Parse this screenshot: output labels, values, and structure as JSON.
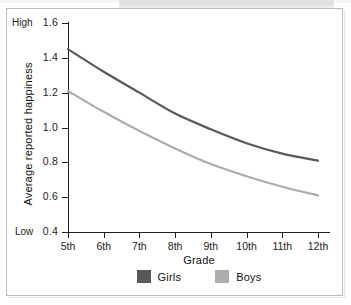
{
  "figure": {
    "background_color": "#ffffff",
    "frame_color": "#b9b9b9"
  },
  "chart_data": {
    "type": "line",
    "title": "",
    "xlabel": "Grade",
    "ylabel": "Average reported happiness",
    "categories": [
      "5th",
      "6th",
      "7th",
      "8th",
      "9th",
      "10th",
      "11th",
      "12th"
    ],
    "x": [
      5,
      6,
      7,
      8,
      9,
      10,
      11,
      12
    ],
    "xlim": [
      5,
      12
    ],
    "ylim": [
      0.4,
      1.6
    ],
    "yticks": [
      "1.6",
      "1.4",
      "1.2",
      "1.0",
      "0.8",
      "0.6",
      "0.4"
    ],
    "ytick_values": [
      1.6,
      1.4,
      1.2,
      1.0,
      0.8,
      0.6,
      0.4
    ],
    "y_axis_endpoint_labels": {
      "high": "High",
      "low": "Low"
    },
    "grid": false,
    "legend_position": "bottom-center",
    "series": [
      {
        "name": "Girls",
        "color": "#595959",
        "values": [
          1.45,
          1.32,
          1.2,
          1.08,
          0.99,
          0.91,
          0.85,
          0.81
        ]
      },
      {
        "name": "Boys",
        "color": "#adadad",
        "values": [
          1.21,
          1.09,
          0.98,
          0.88,
          0.79,
          0.72,
          0.66,
          0.61
        ]
      }
    ]
  }
}
